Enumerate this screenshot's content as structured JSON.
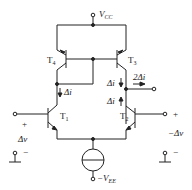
{
  "diagram": {
    "type": "circuit",
    "supply": {
      "top": "V",
      "top_sub": "CC",
      "bottom": "−V",
      "bottom_sub": "EE"
    },
    "transistors": [
      {
        "name": "T",
        "sub": "4",
        "role": "mirror-left (PNP)"
      },
      {
        "name": "T",
        "sub": "3",
        "role": "mirror-right (PNP)"
      },
      {
        "name": "T",
        "sub": "1",
        "role": "diff-pair-left (NPN)"
      },
      {
        "name": "T",
        "sub": "2",
        "role": "diff-pair-right (NPN)"
      }
    ],
    "currents": {
      "left": "Δi",
      "right_top": "Δi",
      "right_bottom": "Δi",
      "output": "2Δi"
    },
    "inputs": {
      "left": {
        "plus": "+",
        "signal": "Δv",
        "minus": "−"
      },
      "right": {
        "plus": "+",
        "signal": "−Δv",
        "minus": "−"
      }
    },
    "colors": {
      "line": "#222222",
      "background": "#ffffff"
    }
  }
}
